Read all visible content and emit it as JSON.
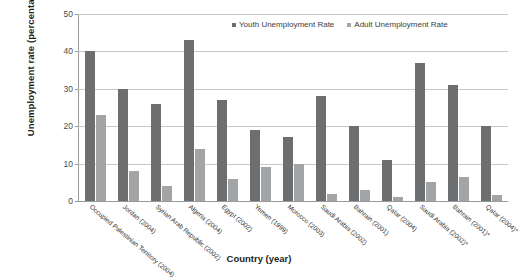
{
  "chart_data": {
    "type": "bar",
    "title": "",
    "xlabel": "Country (year)",
    "ylabel": "Unemployment rate (percentage)",
    "ylim": [
      0,
      50
    ],
    "yticks": [
      0,
      10,
      20,
      30,
      40,
      50
    ],
    "grid": true,
    "legend_position": "top-right",
    "categories": [
      "Occupied Palestinian Territory (2004)",
      "Jordan (2004)",
      "Syrian Arab Republic (2002)",
      "Algeria (2004)",
      "Egypt (2002)",
      "Yemen (1999)",
      "Morocco (2003)",
      "Saudi Arabia (2002)",
      "Bahrain (2001)",
      "Qatar (2004)",
      "Saudi Arabia (2002)*",
      "Bahrain (2001)*",
      "Qatar (2004)*"
    ],
    "series": [
      {
        "name": "Youth Unemployment Rate",
        "color": "#6d6e70",
        "values": [
          40,
          30,
          26,
          43,
          27,
          19,
          17,
          28,
          20,
          11,
          37,
          31,
          20
        ]
      },
      {
        "name": "Adult Unemployment Rate",
        "color": "#a3a4a6",
        "values": [
          23,
          8,
          4,
          14,
          6,
          9,
          10,
          2,
          3,
          1,
          5,
          6.5,
          1.5
        ]
      }
    ]
  },
  "colors": {
    "youth": "#6d6e70",
    "adult": "#a3a4a6",
    "gridline": "#c8c8c8",
    "axis": "#9a9a9a",
    "text": "#231f20"
  }
}
